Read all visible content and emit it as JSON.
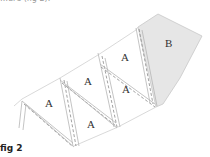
{
  "header": {
    "partial_text": "…ure (fig 2)."
  },
  "diagram": {
    "panels": [
      {
        "label": "A",
        "x": 48,
        "y": 107
      },
      {
        "label": "A",
        "x": 87,
        "y": 85
      },
      {
        "label": "A",
        "x": 124,
        "y": 61
      },
      {
        "label": "A",
        "x": 126,
        "y": 93
      },
      {
        "label": "A",
        "x": 91,
        "y": 128
      },
      {
        "label": "B",
        "x": 169,
        "y": 47
      }
    ],
    "colors": {
      "line": "#b5b5b5",
      "dash": "#7a7a7a",
      "shade": "#e6e6e6"
    }
  },
  "caption": "fig 2"
}
